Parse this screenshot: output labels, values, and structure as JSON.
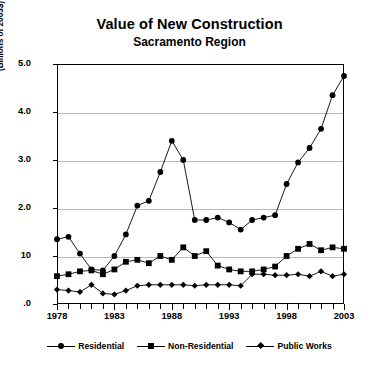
{
  "chart_data": {
    "type": "line",
    "title": "Value of New Construction",
    "subtitle": "Sacramento Region",
    "xlabel": "",
    "ylabel": "(Billions of 2003$)",
    "ylim": [
      0.0,
      5.0
    ],
    "xlim": [
      1978,
      2003
    ],
    "grid": true,
    "legend_position": "bottom",
    "y_ticks": [
      "5.0",
      "4.0",
      "3.0",
      "2.0",
      "10",
      ".0"
    ],
    "y_tick_values": [
      5.0,
      4.0,
      3.0,
      2.0,
      1.0,
      0.0
    ],
    "x_ticks": [
      "1978",
      "1983",
      "1988",
      "1993",
      "1998",
      "2003"
    ],
    "x": [
      1978,
      1979,
      1980,
      1981,
      1982,
      1983,
      1984,
      1985,
      1986,
      1987,
      1988,
      1989,
      1990,
      1991,
      1992,
      1993,
      1994,
      1995,
      1996,
      1997,
      1998,
      1999,
      2000,
      2001,
      2002,
      2003
    ],
    "series": [
      {
        "name": "Residential",
        "marker": "circle",
        "values": [
          1.35,
          1.4,
          1.05,
          0.72,
          0.7,
          1.0,
          1.45,
          2.05,
          2.15,
          2.75,
          3.4,
          3.0,
          1.75,
          1.75,
          1.8,
          1.7,
          1.55,
          1.75,
          1.8,
          1.85,
          2.5,
          2.95,
          3.25,
          3.65,
          4.35,
          4.75
        ]
      },
      {
        "name": "Non-Residential",
        "marker": "square",
        "values": [
          0.58,
          0.62,
          0.68,
          0.7,
          0.62,
          0.72,
          0.88,
          0.92,
          0.85,
          1.0,
          0.92,
          1.18,
          1.0,
          1.1,
          0.8,
          0.72,
          0.68,
          0.68,
          0.72,
          0.78,
          1.0,
          1.15,
          1.25,
          1.12,
          1.18,
          1.15
        ]
      },
      {
        "name": "Public Works",
        "marker": "diamond",
        "values": [
          0.3,
          0.28,
          0.25,
          0.4,
          0.22,
          0.2,
          0.28,
          0.38,
          0.4,
          0.4,
          0.4,
          0.4,
          0.38,
          0.4,
          0.4,
          0.4,
          0.38,
          0.62,
          0.62,
          0.6,
          0.6,
          0.62,
          0.58,
          0.68,
          0.58,
          0.62
        ]
      }
    ]
  },
  "legend": {
    "items": [
      {
        "label": "Residential",
        "marker": "circle"
      },
      {
        "label": "Non-Residential",
        "marker": "square"
      },
      {
        "label": "Public Works",
        "marker": "diamond"
      }
    ]
  },
  "colors": {
    "ink": "#000000",
    "grid": "#b9b9b9",
    "background": "#ffffff"
  }
}
